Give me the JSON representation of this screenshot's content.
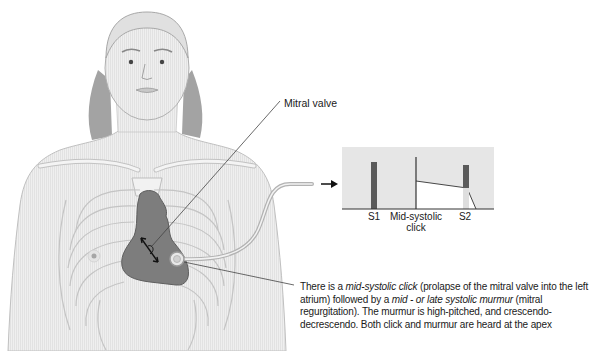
{
  "figure": {
    "icons": [
      "female-torso-illustration",
      "heart-illustration",
      "stethoscope-icon",
      "arrow-right-icon"
    ]
  },
  "labels": {
    "mitral_valve": "Mitral valve"
  },
  "phonocardiogram": {
    "s1": "S1",
    "click_line1": "Mid-systolic",
    "click_line2": "click",
    "s2": "S2"
  },
  "caption": {
    "p1": "There is a ",
    "em1": "mid-systolic click",
    "p2": " (prolapse of the mitral valve into the left atrium) followed by a ",
    "em2": "mid - or late systolic murmur",
    "p3": " (mitral regurgitation). The murmur is high-pitched, and crescendo-decrescendo. Both click and murmur are heard at the apex"
  },
  "colors": {
    "skin": "#ececec",
    "outline": "#b4b4b4",
    "hair": "#9a9a9a",
    "heart": "#7d7d7d",
    "panel_bg": "#e6e6e6",
    "sound_bar": "#5a5a5a",
    "text": "#1a1a1a"
  }
}
